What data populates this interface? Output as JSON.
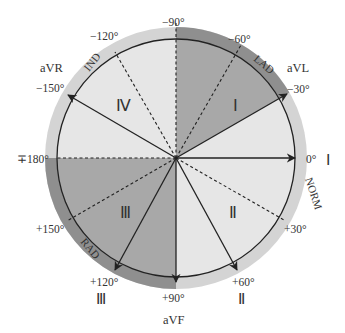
{
  "diagram": {
    "center": {
      "x": 176,
      "y": 158
    },
    "inner_radius": 119,
    "outer_radius": 131,
    "colors": {
      "outer_ring_light": "#d4d4d4",
      "outer_ring_dark": "#8f8f8f",
      "sector_light": "#e6e6e6",
      "sector_dark": "#a8a8a8",
      "line": "#222222",
      "text": "#333333"
    },
    "angle_labels": {
      "m90": "−90°",
      "m60": "−60°",
      "m30": "−30°",
      "zero": "0°",
      "p30": "+30°",
      "p60": "+60°",
      "p90": "+90°",
      "p120": "+120°",
      "p150": "+150°",
      "p180": "∓180°",
      "m150": "−150°",
      "m120": "−120°"
    },
    "lead_labels": {
      "I": "Ⅰ",
      "II": "Ⅱ",
      "III": "Ⅲ",
      "aVR": "aVR",
      "aVL": "aVL",
      "aVF": "aVF"
    },
    "region_labels": {
      "LAD": "LAD",
      "RAD": "RAD",
      "NORM": "NORM",
      "IND": "IND"
    },
    "quadrant_labels": {
      "q1": "Ⅰ",
      "q2": "Ⅱ",
      "q3": "Ⅲ",
      "q4": "Ⅳ"
    },
    "solid_axes_deg": [
      -150,
      -30,
      0,
      60,
      90,
      120
    ],
    "dashed_axes_deg": [
      -120,
      -90,
      -60,
      30,
      150,
      180
    ]
  }
}
